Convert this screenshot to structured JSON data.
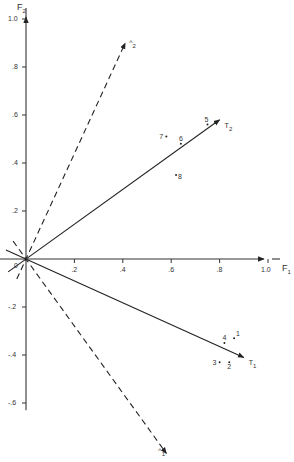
{
  "chart_data": {
    "type": "scatter",
    "title": "",
    "xlabel": "F1",
    "ylabel": "F2",
    "xlim": [
      -0.1,
      1.1
    ],
    "ylim": [
      -0.8,
      1.05
    ],
    "grid": false,
    "x_ticks": [
      {
        "value": 0.2,
        "label": ".2"
      },
      {
        "value": 0.4,
        "label": ".4"
      },
      {
        "value": 0.6,
        "label": ".6"
      },
      {
        "value": 0.8,
        "label": ".8"
      },
      {
        "value": 1.0,
        "label": "1.0"
      }
    ],
    "y_ticks": [
      {
        "value": 1.0,
        "label": "1.0"
      },
      {
        "value": 0.8,
        "label": ".8"
      },
      {
        "value": 0.6,
        "label": ".6"
      },
      {
        "value": 0.4,
        "label": ".4"
      },
      {
        "value": 0.2,
        "label": ".2"
      },
      {
        "value": -0.2,
        "label": "-.2"
      },
      {
        "value": -0.4,
        "label": "-.4"
      },
      {
        "value": -0.6,
        "label": "-.6"
      }
    ],
    "origin_label": "0",
    "vectors": [
      {
        "name": "T1",
        "base": "T",
        "sub": "1",
        "style": "solid",
        "x": 0.9,
        "y": -0.41
      },
      {
        "name": "T2",
        "base": "T",
        "sub": "2",
        "style": "solid",
        "x": 0.8,
        "y": 0.58
      },
      {
        "name": "Λ1",
        "base": "^",
        "sub": "1",
        "style": "dashed",
        "x": 0.58,
        "y": -0.81
      },
      {
        "name": "Λ2",
        "base": "^",
        "sub": "2",
        "style": "dashed",
        "x": 0.41,
        "y": 0.9
      }
    ],
    "points": [
      {
        "label": "1",
        "x": 0.86,
        "y": -0.33
      },
      {
        "label": "2",
        "x": 0.84,
        "y": -0.43
      },
      {
        "label": "3",
        "x": 0.8,
        "y": -0.43
      },
      {
        "label": "4",
        "x": 0.82,
        "y": -0.35
      },
      {
        "label": "5",
        "x": 0.75,
        "y": 0.56
      },
      {
        "label": "6",
        "x": 0.64,
        "y": 0.48
      },
      {
        "label": "7",
        "x": 0.58,
        "y": 0.51
      },
      {
        "label": "8",
        "x": 0.62,
        "y": 0.35
      }
    ]
  },
  "axes": {
    "f1": {
      "base": "F",
      "sub": "1"
    },
    "f2": {
      "base": "F",
      "sub": "2"
    }
  }
}
